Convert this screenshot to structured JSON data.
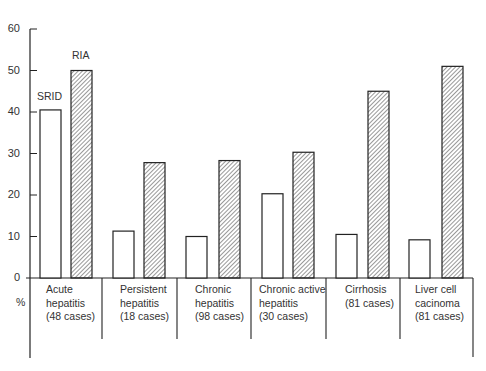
{
  "chart_data": {
    "type": "bar",
    "title": "",
    "xlabel": "",
    "ylabel": "%",
    "ylim": [
      0,
      60
    ],
    "yticks": [
      0,
      10,
      20,
      30,
      40,
      50,
      60
    ],
    "grid": false,
    "legend_position": "inline labels above first group",
    "categories": [
      "Acute hepatitis (48 cases)",
      "Persistent hepatitis (18 cases)",
      "Chronic hepatitis (98 cases)",
      "Chronic active hepatitis (30 cases)",
      "Cirrhosis (81 cases)",
      "Liver cell cacinoma (81 cases)"
    ],
    "series": [
      {
        "name": "SRID",
        "style": "open",
        "values": [
          40.5,
          11.3,
          10.0,
          20.3,
          10.5,
          9.2
        ]
      },
      {
        "name": "RIA",
        "style": "hatched",
        "values": [
          50.0,
          27.8,
          28.3,
          30.3,
          45.0,
          51.0
        ]
      }
    ]
  },
  "labels": {
    "y_unit": "%",
    "series_srid": "SRID",
    "series_ria": "RIA",
    "yticks": [
      "0",
      "10",
      "20",
      "30",
      "40",
      "50",
      "60"
    ],
    "categories": [
      "Acute\nhepatitis\n(48 cases)",
      "Persistent\nhepatitis\n(18 cases)",
      "Chronic\nhepatitis\n(98 cases)",
      "Chronic active\nhepatitis\n(30 cases)",
      "Cirrhosis\n(81 cases)",
      "Liver cell\ncacinoma\n(81 cases)"
    ]
  }
}
